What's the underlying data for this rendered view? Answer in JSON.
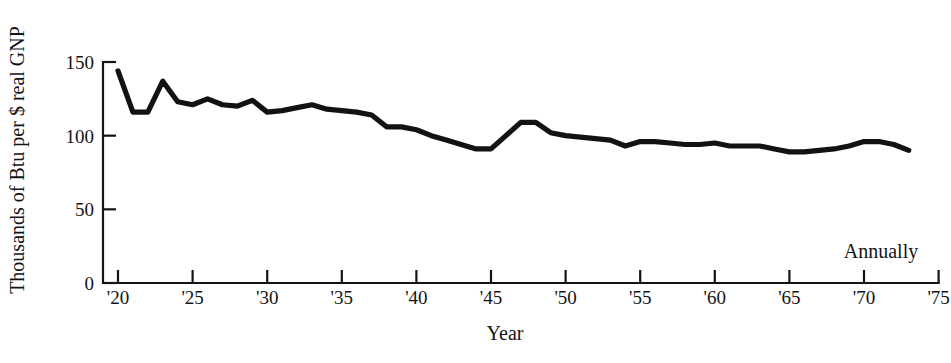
{
  "chart_data": {
    "type": "line",
    "title": "",
    "xlabel": "Year",
    "ylabel": "Thousands of Btu per $ real GNP",
    "annotation": "Annually",
    "grid": false,
    "legend": "none",
    "xlim": [
      1919.5,
      1975
    ],
    "ylim": [
      0,
      150
    ],
    "y_ticks": [
      0,
      50,
      100,
      150
    ],
    "y_tick_labels": [
      "0",
      "50",
      "100",
      "150"
    ],
    "x_ticks": [
      1920,
      1925,
      1930,
      1935,
      1940,
      1945,
      1950,
      1955,
      1960,
      1965,
      1970,
      1975
    ],
    "x_tick_labels": [
      "'20",
      "'25",
      "'30",
      "'35",
      "'40",
      "'45",
      "'50",
      "'55",
      "'60",
      "'65",
      "'70",
      "'75"
    ],
    "series": [
      {
        "name": "Energy intensity",
        "color": "#121212",
        "x": [
          1920,
          1921,
          1922,
          1923,
          1924,
          1925,
          1926,
          1927,
          1928,
          1929,
          1930,
          1931,
          1932,
          1933,
          1934,
          1935,
          1936,
          1937,
          1938,
          1939,
          1940,
          1941,
          1942,
          1943,
          1944,
          1945,
          1946,
          1947,
          1948,
          1949,
          1950,
          1951,
          1952,
          1953,
          1954,
          1955,
          1956,
          1957,
          1958,
          1959,
          1960,
          1961,
          1962,
          1963,
          1964,
          1965,
          1966,
          1967,
          1968,
          1969,
          1970,
          1971,
          1972,
          1973
        ],
        "values": [
          144,
          116,
          116,
          137,
          123,
          121,
          125,
          121,
          120,
          124,
          116,
          117,
          119,
          121,
          118,
          117,
          116,
          114,
          106,
          106,
          104,
          100,
          97,
          94,
          91,
          91,
          100,
          109,
          109,
          102,
          100,
          99,
          98,
          97,
          93,
          96,
          96,
          95,
          94,
          94,
          95,
          93,
          93,
          93,
          91,
          89,
          89,
          90,
          91,
          93,
          96,
          96,
          94,
          90
        ]
      }
    ]
  }
}
